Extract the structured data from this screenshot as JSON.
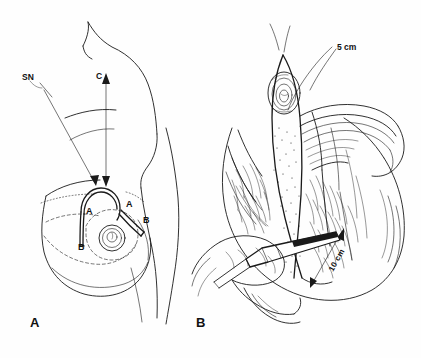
{
  "figure": {
    "style": "black and white line drawing / medical illustration",
    "background_color": "#fefefe",
    "ink_color": "#1a1a1a"
  },
  "panels": [
    {
      "id": "A",
      "label": "A",
      "caption": "Preoperative skin markings on the chest and breast",
      "annotations": [
        {
          "name": "sternal-notch",
          "text": "SN",
          "description": "Sternal notch reference point with leader arrow to nipple position"
        },
        {
          "name": "clavicle",
          "text": "C",
          "description": "Clavicle reference line with double-headed vertical measuring arrow"
        }
      ],
      "incision_marks": [
        {
          "name": "mark-a-left",
          "text": "A"
        },
        {
          "name": "mark-a-right",
          "text": "A"
        },
        {
          "name": "mark-b-left",
          "text": "B"
        },
        {
          "name": "mark-b-right",
          "text": "B"
        }
      ]
    },
    {
      "id": "B",
      "label": "B",
      "caption": "Intraoperative view: dermoglandular flap elevated, hand retracting with instrument",
      "measurements": [
        {
          "name": "measurement-5cm",
          "text": "5 cm",
          "value": 5,
          "unit": "cm",
          "description": "Upper flap width indicated by leader line"
        },
        {
          "name": "measurement-10cm",
          "text": "10 cm",
          "value": 10,
          "unit": "cm",
          "description": "Pedicle length indicated by double-headed arrow"
        }
      ]
    }
  ]
}
